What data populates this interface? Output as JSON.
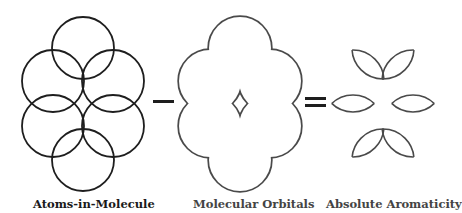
{
  "diagram": {
    "equation": [
      "Atoms-in-Molecule",
      "-",
      "Molecular Orbitals",
      "=",
      "Absolute Aromaticity"
    ],
    "labels": {
      "atoms": "Atoms-in-Molecule",
      "orbitals": "Molecular Orbitals",
      "aromaticity": "Absolute Aromaticity"
    },
    "operators": {
      "minus": "−",
      "equals": "="
    },
    "colors": {
      "stroke_dark": "#1e1e1e",
      "stroke_gray": "#4a4a4a",
      "background": "#ffffff"
    }
  }
}
